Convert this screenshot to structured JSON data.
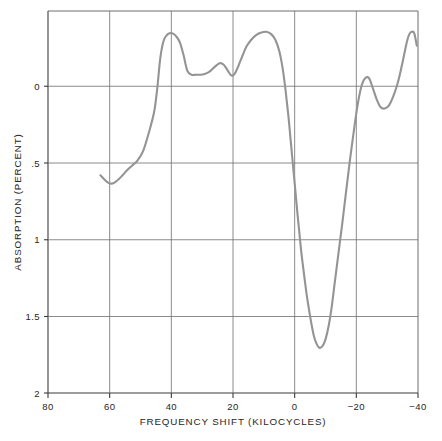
{
  "chart_data": {
    "type": "line",
    "title": "",
    "xlabel": "FREQUENCY SHIFT (KILOCYCLES)",
    "ylabel": "ABSORPTION (PERCENT)",
    "xlim": [
      80,
      -40
    ],
    "ylim": [
      2,
      0
    ],
    "y_inverted": true,
    "grid": true,
    "legend": null,
    "xticks": [
      80,
      60,
      40,
      20,
      0,
      -20,
      -40
    ],
    "xtick_labels": [
      "80",
      "60",
      "40",
      "20",
      "0",
      "−20",
      "−40"
    ],
    "yticks": [
      0,
      0.5,
      1,
      1.5,
      2
    ],
    "ytick_labels": [
      "0",
      ".5",
      "1",
      "1.5",
      "2"
    ],
    "series": [
      {
        "name": "absorption",
        "color": "#949494",
        "x": [
          63.0,
          61.6,
          60.4,
          59.3,
          58.2,
          57.0,
          55.6,
          54.2,
          52.6,
          51.0,
          49.2,
          47.4,
          45.6,
          44.6,
          43.6,
          42.6,
          41.6,
          40.6,
          39.6,
          38.4,
          37.2,
          36.0,
          34.8,
          33.4,
          32.0,
          30.6,
          29.2,
          27.6,
          26.0,
          24.4,
          23.0,
          21.8,
          20.8,
          20.0,
          19.2,
          18.2,
          17.0,
          15.6,
          14.0,
          12.4,
          10.8,
          9.2,
          7.6,
          6.2,
          5.0,
          4.0,
          3.2,
          2.6,
          2.0,
          1.4,
          0.8,
          0.2,
          -0.4,
          -1.0,
          -1.6,
          -2.2,
          -3.0,
          -3.8,
          -4.6,
          -5.4,
          -6.2,
          -7.0,
          -8.0,
          -9.0,
          -10.0,
          -11.0,
          -12.0,
          -13.0,
          -14.2,
          -15.4,
          -16.6,
          -18.0,
          -19.4,
          -20.6,
          -21.8,
          -23.0,
          -24.2,
          -25.4,
          -26.6,
          -27.8,
          -29.2,
          -30.6,
          -32.0,
          -33.4,
          -34.6,
          -35.6,
          -36.4,
          -37.2,
          -38.0,
          -38.8,
          -39.6
        ],
        "y": [
          0.58,
          0.61,
          0.63,
          0.635,
          0.625,
          0.605,
          0.575,
          0.545,
          0.515,
          0.485,
          0.425,
          0.31,
          0.17,
          0.02,
          -0.18,
          -0.29,
          -0.33,
          -0.345,
          -0.345,
          -0.325,
          -0.285,
          -0.2,
          -0.1,
          -0.075,
          -0.075,
          -0.075,
          -0.08,
          -0.095,
          -0.125,
          -0.15,
          -0.14,
          -0.105,
          -0.075,
          -0.07,
          -0.09,
          -0.135,
          -0.195,
          -0.26,
          -0.305,
          -0.335,
          -0.35,
          -0.355,
          -0.34,
          -0.3,
          -0.23,
          -0.13,
          -0.015,
          0.09,
          0.2,
          0.33,
          0.46,
          0.59,
          0.72,
          0.85,
          0.97,
          1.09,
          1.22,
          1.345,
          1.45,
          1.545,
          1.625,
          1.675,
          1.705,
          1.695,
          1.65,
          1.565,
          1.44,
          1.28,
          1.09,
          0.9,
          0.7,
          0.47,
          0.26,
          0.1,
          -0.01,
          -0.055,
          -0.05,
          0.015,
          0.085,
          0.135,
          0.145,
          0.125,
          0.065,
          -0.02,
          -0.12,
          -0.215,
          -0.29,
          -0.34,
          -0.355,
          -0.345,
          -0.265
        ]
      }
    ],
    "annotations": []
  },
  "axes": {
    "x_title": "FREQUENCY SHIFT (KILOCYCLES)",
    "y_title": "ABSORPTION (PERCENT)"
  },
  "ticks": {
    "x": [
      {
        "label": "80"
      },
      {
        "label": "60"
      },
      {
        "label": "40"
      },
      {
        "label": "20"
      },
      {
        "label": "0"
      },
      {
        "label": "−20"
      },
      {
        "label": "−40"
      }
    ],
    "y": [
      {
        "label": "0"
      },
      {
        "label": ".5"
      },
      {
        "label": "1"
      },
      {
        "label": "1.5"
      },
      {
        "label": "2"
      }
    ]
  },
  "colors": {
    "curve": "#949494",
    "axis": "#3b3b3b",
    "grid": "#6d6d6d",
    "background": "#ffffff"
  }
}
